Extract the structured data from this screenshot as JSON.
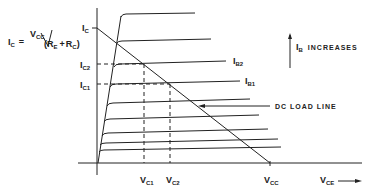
{
  "diagram": {
    "equation": {
      "lhs_main": "I",
      "lhs_sub": "C",
      "equals": "=",
      "num_main": "V",
      "num_sub": "CC",
      "den_open": "(",
      "den_r1_main": "R",
      "den_r1_sub": "E",
      "plus": "+",
      "den_r2_main": "R",
      "den_r2_sub": "C",
      "den_close": ")"
    },
    "y_axis": {
      "ic_label_main": "I",
      "ic_label_sub": "C",
      "ic2_label_main": "I",
      "ic2_label_sub": "C2",
      "ic1_label_main": "I",
      "ic1_label_sub": "C1"
    },
    "x_axis": {
      "vc1_main": "V",
      "vc1_sub": "C1",
      "vc2_main": "V",
      "vc2_sub": "C2",
      "vcc_main": "V",
      "vcc_sub": "CC",
      "vce_main": "V",
      "vce_sub": "CE"
    },
    "curve_labels": {
      "ib2_main": "I",
      "ib2_sub": "B2",
      "ib1_main": "I",
      "ib1_sub": "B1"
    },
    "annotations": {
      "ib_increases_main": "I",
      "ib_increases_sub": "B",
      "ib_increases_text": "INCREASES",
      "load_line": "DC LOAD LINE"
    },
    "colors": {
      "ink": "#222222",
      "background": "#ffffff"
    }
  }
}
